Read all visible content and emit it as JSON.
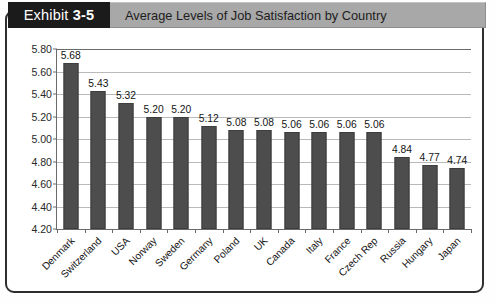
{
  "header": {
    "exhibit_label": "Exhibit",
    "exhibit_number": "3-5",
    "title": "Average Levels of Job Satisfaction by Country"
  },
  "colors": {
    "bar": "#4d4d4d",
    "header_block": "#1b1b1b",
    "title_bar": "#a8a8a8",
    "frame": "#2e2e2e",
    "gridline": "#b9b9b9"
  },
  "chart_data": {
    "type": "bar",
    "title": "Average Levels of Job Satisfaction by Country",
    "xlabel": "",
    "ylabel": "",
    "ylim": [
      4.2,
      5.8
    ],
    "ytick_step": 0.2,
    "yticks": [
      "5.80",
      "5.60",
      "5.40",
      "5.20",
      "5.00",
      "4.80",
      "4.60",
      "4.40",
      "4.20"
    ],
    "grid": true,
    "legend": "none",
    "categories": [
      "Denmark",
      "Switzerland",
      "USA",
      "Norway",
      "Sweden",
      "Germany",
      "Poland",
      "UK",
      "Canada",
      "Italy",
      "France",
      "Czech Rep",
      "Russia",
      "Hungary",
      "Japan"
    ],
    "values": [
      5.68,
      5.43,
      5.32,
      5.2,
      5.2,
      5.12,
      5.08,
      5.08,
      5.06,
      5.06,
      5.06,
      5.06,
      4.84,
      4.77,
      4.74
    ],
    "value_labels": [
      "5.68",
      "5.43",
      "5.32",
      "5.20",
      "5.20",
      "5.12",
      "5.08",
      "5.08",
      "5.06",
      "5.06",
      "5.06",
      "5.06",
      "4.84",
      "4.77",
      "4.74"
    ]
  }
}
